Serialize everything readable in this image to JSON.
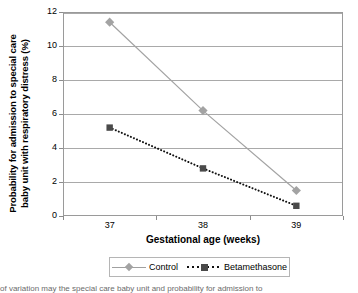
{
  "chart_data": {
    "type": "line",
    "title": "",
    "xlabel": "Gestational age (weeks)",
    "ylabel_line1": "Probability for admission to special care",
    "ylabel_line2": "baby unit with respiratory distress (%)",
    "categories": [
      "37",
      "38",
      "39"
    ],
    "series": [
      {
        "name": "Control",
        "values": [
          11.4,
          6.2,
          1.5
        ],
        "color": "#a3a3a3",
        "marker": "diamond",
        "linestyle": "solid"
      },
      {
        "name": "Betamethasone",
        "values": [
          5.2,
          2.8,
          0.6
        ],
        "color": "#4a4a4a",
        "marker": "square",
        "linestyle": "dotted"
      }
    ],
    "ylim": [
      0,
      12
    ],
    "yticks": [
      "0",
      "2",
      "4",
      "6",
      "8",
      "10",
      "12"
    ],
    "grid": true,
    "legend_position": "bottom"
  },
  "legend": {
    "entries": [
      {
        "label": "Control"
      },
      {
        "label": "Betamethasone"
      }
    ]
  },
  "caption": {
    "clipped_text": "of variation may the special care baby unit and probability for admission to"
  }
}
